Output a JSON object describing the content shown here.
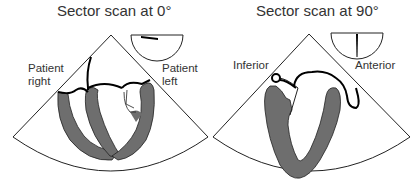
{
  "panels": [
    {
      "title": "Sector scan at 0°",
      "labels": {
        "left_line1": "Patient",
        "left_line2": "right",
        "right_line1": "Patient",
        "right_line2": "left"
      },
      "orientation_icon": "semicircle-with-horizontal-marker"
    },
    {
      "title": "Sector scan at 90°",
      "labels": {
        "left": "Inferior",
        "right": "Anterior"
      },
      "orientation_icon": "semicircle-with-vertical-marker"
    }
  ],
  "colors": {
    "myocardium": "#6e6e6e",
    "outline": "#000000",
    "background": "#ffffff"
  }
}
